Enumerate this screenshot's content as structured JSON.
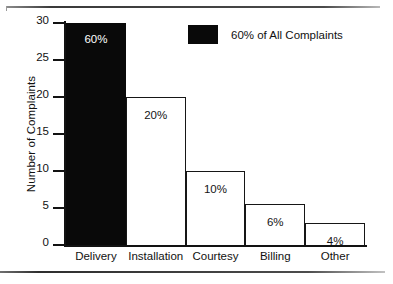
{
  "chart_data": {
    "type": "bar",
    "title": "",
    "subtitle": "",
    "xlabel": "",
    "ylabel": "Number of Complaints",
    "categories": [
      "Delivery",
      "Installation",
      "Courtesy",
      "Billing",
      "Other"
    ],
    "values": [
      30,
      20,
      10,
      5.5,
      3
    ],
    "point_labels": [
      "60%",
      "20%",
      "10%",
      "6%",
      "4%"
    ],
    "series": [
      {
        "name": "Number of Complaints",
        "values": [
          30,
          20,
          10,
          5.5,
          3
        ]
      }
    ],
    "bar_styles": [
      "filled",
      "hollow",
      "hollow",
      "hollow",
      "hollow"
    ],
    "ylim": [
      0,
      30
    ],
    "ytick_labels": [
      "0",
      "5",
      "10",
      "15",
      "20",
      "25",
      "30"
    ],
    "ytick_values": [
      0,
      5,
      10,
      15,
      20,
      25,
      30
    ],
    "grid": false,
    "legend_position": "top-center",
    "legend": [
      {
        "label": "60% of All Complaints",
        "color": "#090909",
        "swatch": "filled-square"
      }
    ],
    "colors": {
      "bar_fill_highlight": "#090909",
      "bar_fill_default": "#ffffff",
      "bar_outline": "#161616",
      "axis": "#121212",
      "text": "#111111",
      "label_on_dark": "#ffffff",
      "background": "#ffffff"
    }
  }
}
